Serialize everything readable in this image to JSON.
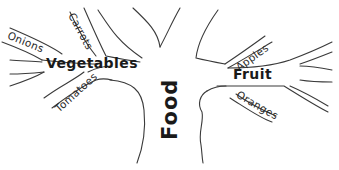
{
  "diagram": {
    "type": "tree",
    "root": {
      "label": "Food"
    },
    "branches": [
      {
        "label": "Vegetables",
        "side": "left",
        "leaves": [
          "Onions",
          "Carrots",
          "Tomatoes"
        ]
      },
      {
        "label": "Fruit",
        "side": "right",
        "leaves": [
          "Apples",
          "Oranges"
        ]
      }
    ],
    "colors": {
      "ink": "#2a2a2a",
      "background": "#ffffff"
    }
  }
}
